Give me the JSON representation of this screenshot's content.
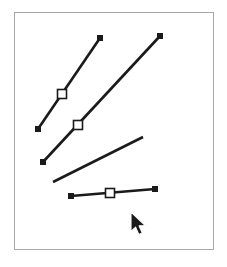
{
  "app": {
    "title": "Vector line drawing canvas",
    "background_color": "#ffffff"
  },
  "canvas": {
    "name": "drawing-canvas",
    "frame": {
      "x": 14,
      "y": 12,
      "width": 200,
      "height": 238,
      "border_color": "#a8a8a8",
      "border_width": 1,
      "fill_color": "#ffffff"
    }
  },
  "style": {
    "line_color": "#1a1a1a",
    "line_width": 2.6,
    "endpoint_fill": "#1a1a1a",
    "endpoint_size": 6,
    "handle_fill": "#ffffff",
    "handle_stroke": "#1a1a1a",
    "handle_size": 9,
    "handle_stroke_width": 1.6,
    "cursor_fill": "#1a1a1a",
    "cursor_outline": "#ffffff"
  },
  "shapes": [
    {
      "id": "line-1",
      "name": "line-segment-1",
      "type": "line",
      "selected": true,
      "x1": 38,
      "y1": 129,
      "x2": 100,
      "y2": 38,
      "endpoints": [
        {
          "name": "endpoint-start",
          "x": 38,
          "y": 129,
          "style": "filled-square"
        },
        {
          "name": "endpoint-end",
          "x": 100,
          "y": 38,
          "style": "filled-square"
        }
      ],
      "handles": [
        {
          "name": "midpoint-handle",
          "x": 62,
          "y": 94,
          "style": "hollow-square"
        }
      ]
    },
    {
      "id": "line-2",
      "name": "line-segment-2",
      "type": "line",
      "selected": true,
      "x1": 43,
      "y1": 162,
      "x2": 160,
      "y2": 36,
      "endpoints": [
        {
          "name": "endpoint-start",
          "x": 43,
          "y": 162,
          "style": "filled-square"
        },
        {
          "name": "endpoint-end",
          "x": 160,
          "y": 36,
          "style": "filled-square"
        }
      ],
      "handles": [
        {
          "name": "midpoint-handle",
          "x": 78,
          "y": 125,
          "style": "hollow-square"
        }
      ]
    },
    {
      "id": "line-3",
      "name": "line-segment-3",
      "type": "line",
      "selected": false,
      "x1": 53,
      "y1": 182,
      "x2": 143,
      "y2": 137,
      "endpoints": [],
      "handles": []
    },
    {
      "id": "line-4",
      "name": "line-segment-4",
      "type": "line",
      "selected": true,
      "x1": 71,
      "y1": 196,
      "x2": 155,
      "y2": 189,
      "endpoints": [
        {
          "name": "endpoint-start",
          "x": 71,
          "y": 196,
          "style": "filled-square"
        },
        {
          "name": "endpoint-end",
          "x": 155,
          "y": 189,
          "style": "filled-square"
        }
      ],
      "handles": [
        {
          "name": "midpoint-handle",
          "x": 110,
          "y": 193,
          "style": "hollow-square"
        }
      ]
    }
  ],
  "cursor": {
    "name": "mouse-pointer",
    "type": "arrow",
    "x": 131,
    "y": 212,
    "scale": 1.0
  }
}
